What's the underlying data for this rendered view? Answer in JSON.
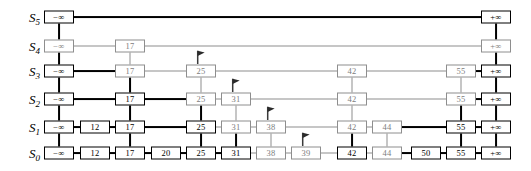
{
  "figure": {
    "kind": "skip-list-search-diagram",
    "neg_infinity": "−∞",
    "pos_infinity": "+∞",
    "colors": {
      "path_stroke": "#000000",
      "idle_stroke": "#8e8e8e",
      "idle_text": "#7d7d7d",
      "background": "#ffffff"
    }
  },
  "rows": [
    {
      "id": "S5",
      "label": "S",
      "subscript": "5",
      "y": 17
    },
    {
      "id": "S4",
      "label": "S",
      "subscript": "4",
      "y": 46
    },
    {
      "id": "S3",
      "label": "S",
      "subscript": "3",
      "y": 71
    },
    {
      "id": "S2",
      "label": "S",
      "subscript": "2",
      "y": 99
    },
    {
      "id": "S1",
      "label": "S",
      "subscript": "1",
      "y": 127
    },
    {
      "id": "S0",
      "label": "S",
      "subscript": "0",
      "y": 153
    }
  ],
  "label_x": 40,
  "columns": {
    "neg_inf": 59,
    "k12": 95,
    "k17": 130,
    "k20": 166,
    "k25": 201,
    "k31": 236,
    "k38": 271,
    "k39": 306,
    "k42": 352,
    "k44": 387,
    "k50": 426,
    "k55": 461,
    "pos_inf": 496
  },
  "nodes": [
    {
      "row": "S5",
      "col": "neg_inf",
      "value": "−∞",
      "state": "path",
      "w": 30,
      "h": 13
    },
    {
      "row": "S5",
      "col": "pos_inf",
      "value": "+∞",
      "state": "path",
      "w": 30,
      "h": 13
    },
    {
      "row": "S4",
      "col": "neg_inf",
      "value": "−∞",
      "state": "idle",
      "w": 30,
      "h": 13
    },
    {
      "row": "S4",
      "col": "k17",
      "value": "17",
      "state": "idle",
      "w": 30,
      "h": 13
    },
    {
      "row": "S4",
      "col": "pos_inf",
      "value": "+∞",
      "state": "idle",
      "w": 30,
      "h": 13
    },
    {
      "row": "S3",
      "col": "neg_inf",
      "value": "−∞",
      "state": "path",
      "w": 30,
      "h": 13
    },
    {
      "row": "S3",
      "col": "k17",
      "value": "17",
      "state": "idle",
      "w": 30,
      "h": 13
    },
    {
      "row": "S3",
      "col": "k25",
      "value": "25",
      "state": "idle",
      "w": 30,
      "h": 13
    },
    {
      "row": "S3",
      "col": "k42",
      "value": "42",
      "state": "idle",
      "w": 30,
      "h": 13
    },
    {
      "row": "S3",
      "col": "k55",
      "value": "55",
      "state": "idle",
      "w": 30,
      "h": 13
    },
    {
      "row": "S3",
      "col": "pos_inf",
      "value": "+∞",
      "state": "path",
      "w": 30,
      "h": 13
    },
    {
      "row": "S2",
      "col": "neg_inf",
      "value": "−∞",
      "state": "path",
      "w": 30,
      "h": 13
    },
    {
      "row": "S2",
      "col": "k17",
      "value": "17",
      "state": "path",
      "w": 30,
      "h": 13
    },
    {
      "row": "S2",
      "col": "k25",
      "value": "25",
      "state": "idle",
      "w": 30,
      "h": 13
    },
    {
      "row": "S2",
      "col": "k31",
      "value": "31",
      "state": "idle",
      "w": 30,
      "h": 13
    },
    {
      "row": "S2",
      "col": "k42",
      "value": "42",
      "state": "idle",
      "w": 30,
      "h": 13
    },
    {
      "row": "S2",
      "col": "k55",
      "value": "55",
      "state": "idle",
      "w": 30,
      "h": 13
    },
    {
      "row": "S2",
      "col": "pos_inf",
      "value": "+∞",
      "state": "path",
      "w": 30,
      "h": 13
    },
    {
      "row": "S1",
      "col": "neg_inf",
      "value": "−∞",
      "state": "path",
      "w": 30,
      "h": 13
    },
    {
      "row": "S1",
      "col": "k12",
      "value": "12",
      "state": "path",
      "w": 30,
      "h": 13
    },
    {
      "row": "S1",
      "col": "k17",
      "value": "17",
      "state": "path",
      "w": 30,
      "h": 13
    },
    {
      "row": "S1",
      "col": "k25",
      "value": "25",
      "state": "path",
      "w": 30,
      "h": 13
    },
    {
      "row": "S1",
      "col": "k31",
      "value": "31",
      "state": "idle",
      "w": 30,
      "h": 13
    },
    {
      "row": "S1",
      "col": "k38",
      "value": "38",
      "state": "idle",
      "w": 30,
      "h": 13
    },
    {
      "row": "S1",
      "col": "k42",
      "value": "42",
      "state": "idle",
      "w": 30,
      "h": 13
    },
    {
      "row": "S1",
      "col": "k44",
      "value": "44",
      "state": "idle",
      "w": 30,
      "h": 13
    },
    {
      "row": "S1",
      "col": "k55",
      "value": "55",
      "state": "path",
      "w": 30,
      "h": 13
    },
    {
      "row": "S1",
      "col": "pos_inf",
      "value": "+∞",
      "state": "path",
      "w": 30,
      "h": 13
    },
    {
      "row": "S0",
      "col": "neg_inf",
      "value": "−∞",
      "state": "path",
      "w": 30,
      "h": 13
    },
    {
      "row": "S0",
      "col": "k12",
      "value": "12",
      "state": "path",
      "w": 30,
      "h": 13
    },
    {
      "row": "S0",
      "col": "k17",
      "value": "17",
      "state": "path",
      "w": 30,
      "h": 13
    },
    {
      "row": "S0",
      "col": "k20",
      "value": "20",
      "state": "path",
      "w": 30,
      "h": 13
    },
    {
      "row": "S0",
      "col": "k25",
      "value": "25",
      "state": "path",
      "w": 30,
      "h": 13
    },
    {
      "row": "S0",
      "col": "k31",
      "value": "31",
      "state": "path",
      "w": 30,
      "h": 13
    },
    {
      "row": "S0",
      "col": "k38",
      "value": "38",
      "state": "idle",
      "w": 30,
      "h": 13
    },
    {
      "row": "S0",
      "col": "k39",
      "value": "39",
      "state": "idle",
      "w": 30,
      "h": 13
    },
    {
      "row": "S0",
      "col": "k42",
      "value": "42",
      "state": "path",
      "w": 30,
      "h": 13
    },
    {
      "row": "S0",
      "col": "k44",
      "value": "44",
      "state": "idle",
      "w": 30,
      "h": 13
    },
    {
      "row": "S0",
      "col": "k50",
      "value": "50",
      "state": "path",
      "w": 30,
      "h": 13
    },
    {
      "row": "S0",
      "col": "k55",
      "value": "55",
      "state": "path",
      "w": 30,
      "h": 13
    },
    {
      "row": "S0",
      "col": "pos_inf",
      "value": "+∞",
      "state": "path",
      "w": 30,
      "h": 13
    }
  ],
  "hlinks": [
    {
      "row": "S5",
      "from": "neg_inf",
      "to": "pos_inf",
      "state": "path"
    },
    {
      "row": "S4",
      "from": "neg_inf",
      "to": "k17",
      "state": "idle"
    },
    {
      "row": "S4",
      "from": "k17",
      "to": "pos_inf",
      "state": "idle"
    },
    {
      "row": "S3",
      "from": "neg_inf",
      "to": "k17",
      "state": "path"
    },
    {
      "row": "S3",
      "from": "k17",
      "to": "k25",
      "state": "idle"
    },
    {
      "row": "S3",
      "from": "k25",
      "to": "k42",
      "state": "idle"
    },
    {
      "row": "S3",
      "from": "k42",
      "to": "k55",
      "state": "idle"
    },
    {
      "row": "S3",
      "from": "k55",
      "to": "pos_inf",
      "state": "path"
    },
    {
      "row": "S2",
      "from": "neg_inf",
      "to": "k17",
      "state": "path"
    },
    {
      "row": "S2",
      "from": "k17",
      "to": "k25",
      "state": "path"
    },
    {
      "row": "S2",
      "from": "k25",
      "to": "k31",
      "state": "idle"
    },
    {
      "row": "S2",
      "from": "k31",
      "to": "k42",
      "state": "idle"
    },
    {
      "row": "S2",
      "from": "k42",
      "to": "k55",
      "state": "idle"
    },
    {
      "row": "S2",
      "from": "k55",
      "to": "pos_inf",
      "state": "path"
    },
    {
      "row": "S1",
      "from": "neg_inf",
      "to": "k12",
      "state": "path"
    },
    {
      "row": "S1",
      "from": "k12",
      "to": "k17",
      "state": "path"
    },
    {
      "row": "S1",
      "from": "k17",
      "to": "k25",
      "state": "path"
    },
    {
      "row": "S1",
      "from": "k25",
      "to": "k31",
      "state": "idle"
    },
    {
      "row": "S1",
      "from": "k31",
      "to": "k38",
      "state": "idle"
    },
    {
      "row": "S1",
      "from": "k38",
      "to": "k42",
      "state": "idle"
    },
    {
      "row": "S1",
      "from": "k42",
      "to": "k44",
      "state": "idle"
    },
    {
      "row": "S1",
      "from": "k44",
      "to": "k55",
      "state": "path"
    },
    {
      "row": "S1",
      "from": "k55",
      "to": "pos_inf",
      "state": "path"
    },
    {
      "row": "S0",
      "from": "neg_inf",
      "to": "k12",
      "state": "path"
    },
    {
      "row": "S0",
      "from": "k12",
      "to": "k17",
      "state": "path"
    },
    {
      "row": "S0",
      "from": "k17",
      "to": "k20",
      "state": "path"
    },
    {
      "row": "S0",
      "from": "k20",
      "to": "k25",
      "state": "path"
    },
    {
      "row": "S0",
      "from": "k25",
      "to": "k31",
      "state": "path"
    },
    {
      "row": "S0",
      "from": "k31",
      "to": "k38",
      "state": "idle"
    },
    {
      "row": "S0",
      "from": "k38",
      "to": "k39",
      "state": "idle"
    },
    {
      "row": "S0",
      "from": "k39",
      "to": "k42",
      "state": "idle"
    },
    {
      "row": "S0",
      "from": "k42",
      "to": "k44",
      "state": "idle"
    },
    {
      "row": "S0",
      "from": "k44",
      "to": "k50",
      "state": "path"
    },
    {
      "row": "S0",
      "from": "k50",
      "to": "k55",
      "state": "path"
    },
    {
      "row": "S0",
      "from": "k55",
      "to": "pos_inf",
      "state": "path"
    }
  ],
  "vlinks": [
    {
      "col": "neg_inf",
      "from": "S5",
      "to": "S4",
      "state": "path"
    },
    {
      "col": "neg_inf",
      "from": "S4",
      "to": "S3",
      "state": "path"
    },
    {
      "col": "neg_inf",
      "from": "S3",
      "to": "S2",
      "state": "path"
    },
    {
      "col": "neg_inf",
      "from": "S2",
      "to": "S1",
      "state": "path"
    },
    {
      "col": "neg_inf",
      "from": "S1",
      "to": "S0",
      "state": "path"
    },
    {
      "col": "k17",
      "from": "S4",
      "to": "S3",
      "state": "idle"
    },
    {
      "col": "k17",
      "from": "S3",
      "to": "S2",
      "state": "path"
    },
    {
      "col": "k17",
      "from": "S2",
      "to": "S1",
      "state": "path"
    },
    {
      "col": "k17",
      "from": "S1",
      "to": "S0",
      "state": "path"
    },
    {
      "col": "k25",
      "from": "S3",
      "to": "S2",
      "state": "idle"
    },
    {
      "col": "k25",
      "from": "S2",
      "to": "S1",
      "state": "path"
    },
    {
      "col": "k25",
      "from": "S1",
      "to": "S0",
      "state": "path"
    },
    {
      "col": "k31",
      "from": "S2",
      "to": "S1",
      "state": "idle"
    },
    {
      "col": "k31",
      "from": "S1",
      "to": "S0",
      "state": "path"
    },
    {
      "col": "k38",
      "from": "S1",
      "to": "S0",
      "state": "idle"
    },
    {
      "col": "k42",
      "from": "S3",
      "to": "S2",
      "state": "idle"
    },
    {
      "col": "k42",
      "from": "S2",
      "to": "S1",
      "state": "idle"
    },
    {
      "col": "k42",
      "from": "S1",
      "to": "S0",
      "state": "path"
    },
    {
      "col": "k44",
      "from": "S1",
      "to": "S0",
      "state": "idle"
    },
    {
      "col": "k55",
      "from": "S3",
      "to": "S2",
      "state": "idle"
    },
    {
      "col": "k55",
      "from": "S2",
      "to": "S1",
      "state": "path"
    },
    {
      "col": "k55",
      "from": "S1",
      "to": "S0",
      "state": "path"
    },
    {
      "col": "pos_inf",
      "from": "S5",
      "to": "S4",
      "state": "path"
    },
    {
      "col": "pos_inf",
      "from": "S4",
      "to": "S3",
      "state": "path"
    },
    {
      "col": "pos_inf",
      "from": "S3",
      "to": "S2",
      "state": "path"
    },
    {
      "col": "pos_inf",
      "from": "S2",
      "to": "S1",
      "state": "path"
    },
    {
      "col": "pos_inf",
      "from": "S1",
      "to": "S0",
      "state": "path"
    }
  ],
  "flags": [
    {
      "name": "flag-marker-s3-25",
      "row": "S3",
      "col": "k25"
    },
    {
      "name": "flag-marker-s2-31",
      "row": "S2",
      "col": "k31"
    },
    {
      "name": "flag-marker-s1-38",
      "row": "S1",
      "col": "k38"
    },
    {
      "name": "flag-marker-s0-39",
      "row": "S0",
      "col": "k39"
    }
  ]
}
